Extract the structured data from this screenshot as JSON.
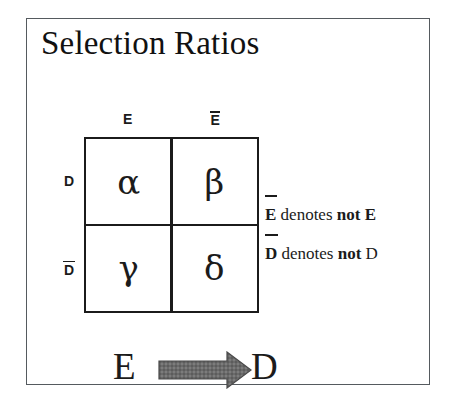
{
  "figure": {
    "title": "Selection Ratios",
    "border_color": "#555a5e",
    "ink_color": "#1b1b1b",
    "background_color": "#ffffff"
  },
  "table": {
    "column_headers": [
      {
        "id": "col-e",
        "label": "E",
        "overline": false
      },
      {
        "id": "col-note",
        "label": "E",
        "overline": true
      }
    ],
    "row_headers": [
      {
        "id": "row-d",
        "label": "D",
        "overline": false
      },
      {
        "id": "row-notd",
        "label": "D",
        "overline": true
      }
    ],
    "cells": [
      {
        "id": "cell-alpha",
        "row": "D",
        "column": "E",
        "symbol": "α"
      },
      {
        "id": "cell-beta",
        "row": "D",
        "column": "not E",
        "symbol": "β"
      },
      {
        "id": "cell-gamma",
        "row": "not D",
        "column": "E",
        "symbol": "γ"
      },
      {
        "id": "cell-delta",
        "row": "not D",
        "column": "not E",
        "symbol": "δ"
      }
    ]
  },
  "legend": {
    "rows": [
      {
        "id": "legend-e",
        "symbol": "E",
        "symbol_overline": true,
        "verb": "denotes",
        "negation": "not",
        "variable": "E",
        "full_text": "Ē denotes not E"
      },
      {
        "id": "legend-d",
        "symbol": "D",
        "symbol_overline": true,
        "verb": "denotes",
        "negation": "not",
        "variable": "D",
        "full_text": "D̄ denotes not D"
      }
    ]
  },
  "implication": {
    "antecedent": "E",
    "consequent": "D",
    "arrow": {
      "icon": "right-block-arrow-icon",
      "direction": "right",
      "fill_color": "#6a6a6a",
      "stroke_color": "#4a4a4a"
    }
  }
}
